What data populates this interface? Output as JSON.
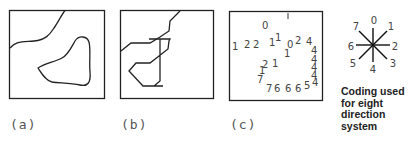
{
  "panels": [
    {
      "id": "a",
      "label": "(a)",
      "description": "Map with a smooth boundary line and a smooth closed region"
    },
    {
      "id": "b",
      "label": "(b)",
      "description": "Same map with boundaries approximated by straight-line segments"
    },
    {
      "id": "c",
      "label": "(c)",
      "description": "Boundaries encoded as chain codes"
    }
  ],
  "chain_code": {
    "digits": [
      {
        "t": "0",
        "x": 262,
        "y": 29
      },
      {
        "t": "1",
        "x": 232,
        "y": 50
      },
      {
        "t": "2",
        "x": 244,
        "y": 48
      },
      {
        "t": "2",
        "x": 253,
        "y": 48
      },
      {
        "t": "1",
        "x": 269,
        "y": 46
      },
      {
        "t": "1",
        "x": 275,
        "y": 41
      },
      {
        "t": "0",
        "x": 287,
        "y": 48
      },
      {
        "t": "2",
        "x": 295,
        "y": 44
      },
      {
        "t": "4",
        "x": 306,
        "y": 45
      },
      {
        "t": "1",
        "x": 284,
        "y": 57
      },
      {
        "t": "4",
        "x": 311,
        "y": 54
      },
      {
        "t": "2",
        "x": 262,
        "y": 68
      },
      {
        "t": "1",
        "x": 272,
        "y": 67
      },
      {
        "t": "4",
        "x": 311,
        "y": 63
      },
      {
        "t": "1",
        "x": 259,
        "y": 74
      },
      {
        "t": "4",
        "x": 311,
        "y": 71
      },
      {
        "t": "7",
        "x": 257,
        "y": 83
      },
      {
        "t": "4",
        "x": 311,
        "y": 79
      },
      {
        "t": "7",
        "x": 266,
        "y": 92
      },
      {
        "t": "6",
        "x": 274,
        "y": 92
      },
      {
        "t": "6",
        "x": 285,
        "y": 92
      },
      {
        "t": "6",
        "x": 295,
        "y": 92
      },
      {
        "t": "5",
        "x": 304,
        "y": 89
      },
      {
        "t": "4",
        "x": 312,
        "y": 86
      }
    ]
  },
  "direction_key": {
    "labels": [
      "0",
      "1",
      "2",
      "3",
      "4",
      "5",
      "6",
      "7"
    ],
    "caption_lines": [
      "Coding used",
      "for eight",
      "direction",
      "system"
    ]
  }
}
